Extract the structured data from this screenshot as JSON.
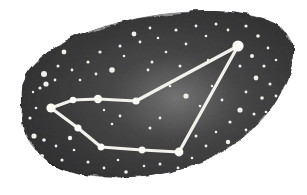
{
  "figure": {
    "kind": "constellation-star-chart-illustration",
    "width": 307,
    "height": 195,
    "background_color": "#ffffff"
  },
  "sky_patch": {
    "name": "dark-sky-blob",
    "description": "Irregular watercolor-washed dark grey patch of night sky with ragged edges",
    "fill_dark": "#2f2f30",
    "fill_mid": "#4a4a4c",
    "fill_light": "#8d8d8e",
    "edge_color": "#1b1b1c",
    "outline_path": "M 22 96 C 20 78, 34 60, 58 46 C 84 30, 120 20, 160 14 C 200 9, 238 10, 262 18 C 284 25, 295 38, 293 56 C 291 78, 280 100, 262 120 C 244 140, 220 156, 190 166 C 158 176, 122 180, 92 176 C 62 172, 40 160, 28 140 C 20 126, 22 110, 22 96 Z",
    "glow": {
      "name": "milky-way-glow",
      "center_x": 176,
      "center_y": 98,
      "radius_x": 62,
      "radius_y": 44,
      "color": "#b9b9b8"
    }
  },
  "constellation": {
    "name": "constellation-figure",
    "line_color": "#f2f1ec",
    "line_width": 3.2,
    "star_color": "#fbfaf5",
    "stars": [
      {
        "id": "apex",
        "label": "apex star",
        "x": 238,
        "y": 46,
        "r": 5.6
      },
      {
        "id": "junction",
        "label": "upper chain junction",
        "x": 136,
        "y": 101,
        "r": 3.6
      },
      {
        "id": "mid-upper",
        "label": "upper chain middle",
        "x": 98,
        "y": 99,
        "r": 4.2
      },
      {
        "id": "inner-upper",
        "label": "upper chain inner",
        "x": 73,
        "y": 100,
        "r": 3.2
      },
      {
        "id": "west-vertex",
        "label": "western vertex star",
        "x": 51,
        "y": 108,
        "r": 4.6
      },
      {
        "id": "lower-inner",
        "label": "lower chain inner",
        "x": 78,
        "y": 128,
        "r": 3.6
      },
      {
        "id": "lower-left",
        "label": "lower chain left",
        "x": 101,
        "y": 147,
        "r": 3.4
      },
      {
        "id": "lower-mid",
        "label": "lower chain middle",
        "x": 142,
        "y": 150,
        "r": 3.4
      },
      {
        "id": "south-vertex",
        "label": "southern vertex star",
        "x": 179,
        "y": 152,
        "r": 4.4
      }
    ],
    "segments": [
      {
        "from": "west-vertex",
        "to": "inner-upper"
      },
      {
        "from": "inner-upper",
        "to": "mid-upper"
      },
      {
        "from": "mid-upper",
        "to": "junction"
      },
      {
        "from": "junction",
        "to": "apex"
      },
      {
        "from": "apex",
        "to": "south-vertex"
      },
      {
        "from": "west-vertex",
        "to": "lower-inner"
      },
      {
        "from": "lower-inner",
        "to": "lower-left"
      },
      {
        "from": "lower-left",
        "to": "lower-mid"
      },
      {
        "from": "lower-mid",
        "to": "south-vertex"
      }
    ]
  },
  "background_stars": {
    "name": "background-star-field",
    "color": "#f0efe9",
    "points": [
      {
        "x": 40,
        "y": 88,
        "r": 1.6
      },
      {
        "x": 33,
        "y": 92,
        "r": 1.2
      },
      {
        "x": 46,
        "y": 84,
        "r": 2.6
      },
      {
        "x": 55,
        "y": 80,
        "r": 1.4
      },
      {
        "x": 44,
        "y": 74,
        "r": 3.0
      },
      {
        "x": 58,
        "y": 66,
        "r": 1.5
      },
      {
        "x": 64,
        "y": 52,
        "r": 2.4
      },
      {
        "x": 72,
        "y": 70,
        "r": 1.4
      },
      {
        "x": 36,
        "y": 108,
        "r": 1.3
      },
      {
        "x": 30,
        "y": 118,
        "r": 1.6
      },
      {
        "x": 34,
        "y": 136,
        "r": 2.6
      },
      {
        "x": 44,
        "y": 140,
        "r": 1.8
      },
      {
        "x": 30,
        "y": 148,
        "r": 1.4
      },
      {
        "x": 42,
        "y": 156,
        "r": 2.0
      },
      {
        "x": 56,
        "y": 146,
        "r": 1.4
      },
      {
        "x": 62,
        "y": 160,
        "r": 1.6
      },
      {
        "x": 74,
        "y": 150,
        "r": 1.3
      },
      {
        "x": 70,
        "y": 138,
        "r": 2.2
      },
      {
        "x": 88,
        "y": 162,
        "r": 1.5
      },
      {
        "x": 104,
        "y": 168,
        "r": 1.4
      },
      {
        "x": 118,
        "y": 160,
        "r": 1.3
      },
      {
        "x": 126,
        "y": 172,
        "r": 1.8
      },
      {
        "x": 80,
        "y": 80,
        "r": 1.3
      },
      {
        "x": 88,
        "y": 62,
        "r": 1.6
      },
      {
        "x": 96,
        "y": 74,
        "r": 1.4
      },
      {
        "x": 100,
        "y": 52,
        "r": 1.6
      },
      {
        "x": 112,
        "y": 70,
        "r": 2.8
      },
      {
        "x": 120,
        "y": 46,
        "r": 1.5
      },
      {
        "x": 124,
        "y": 56,
        "r": 1.3
      },
      {
        "x": 134,
        "y": 34,
        "r": 2.4
      },
      {
        "x": 140,
        "y": 42,
        "r": 1.4
      },
      {
        "x": 150,
        "y": 28,
        "r": 1.4
      },
      {
        "x": 158,
        "y": 38,
        "r": 1.3
      },
      {
        "x": 152,
        "y": 62,
        "r": 1.5
      },
      {
        "x": 148,
        "y": 70,
        "r": 1.4
      },
      {
        "x": 166,
        "y": 52,
        "r": 1.3
      },
      {
        "x": 176,
        "y": 30,
        "r": 1.6
      },
      {
        "x": 186,
        "y": 44,
        "r": 1.4
      },
      {
        "x": 180,
        "y": 66,
        "r": 1.5
      },
      {
        "x": 170,
        "y": 86,
        "r": 1.3
      },
      {
        "x": 186,
        "y": 96,
        "r": 2.6
      },
      {
        "x": 160,
        "y": 118,
        "r": 1.4
      },
      {
        "x": 150,
        "y": 128,
        "r": 1.5
      },
      {
        "x": 112,
        "y": 124,
        "r": 1.3
      },
      {
        "x": 120,
        "y": 116,
        "r": 1.4
      },
      {
        "x": 104,
        "y": 110,
        "r": 1.2
      },
      {
        "x": 196,
        "y": 26,
        "r": 1.4
      },
      {
        "x": 206,
        "y": 36,
        "r": 1.3
      },
      {
        "x": 216,
        "y": 24,
        "r": 1.5
      },
      {
        "x": 228,
        "y": 30,
        "r": 1.4
      },
      {
        "x": 246,
        "y": 26,
        "r": 1.6
      },
      {
        "x": 258,
        "y": 36,
        "r": 1.8
      },
      {
        "x": 268,
        "y": 48,
        "r": 1.4
      },
      {
        "x": 252,
        "y": 56,
        "r": 2.0
      },
      {
        "x": 240,
        "y": 66,
        "r": 1.5
      },
      {
        "x": 264,
        "y": 66,
        "r": 1.6
      },
      {
        "x": 276,
        "y": 60,
        "r": 1.3
      },
      {
        "x": 256,
        "y": 78,
        "r": 2.4
      },
      {
        "x": 270,
        "y": 84,
        "r": 1.5
      },
      {
        "x": 246,
        "y": 92,
        "r": 1.4
      },
      {
        "x": 262,
        "y": 98,
        "r": 1.8
      },
      {
        "x": 276,
        "y": 96,
        "r": 1.4
      },
      {
        "x": 240,
        "y": 110,
        "r": 2.6
      },
      {
        "x": 254,
        "y": 114,
        "r": 1.5
      },
      {
        "x": 266,
        "y": 112,
        "r": 1.3
      },
      {
        "x": 230,
        "y": 122,
        "r": 1.6
      },
      {
        "x": 246,
        "y": 130,
        "r": 1.4
      },
      {
        "x": 216,
        "y": 132,
        "r": 1.3
      },
      {
        "x": 228,
        "y": 142,
        "r": 2.2
      },
      {
        "x": 206,
        "y": 146,
        "r": 1.4
      },
      {
        "x": 196,
        "y": 136,
        "r": 1.5
      },
      {
        "x": 192,
        "y": 158,
        "r": 1.3
      },
      {
        "x": 178,
        "y": 168,
        "r": 1.4
      },
      {
        "x": 160,
        "y": 164,
        "r": 1.5
      },
      {
        "x": 144,
        "y": 166,
        "r": 1.3
      },
      {
        "x": 212,
        "y": 86,
        "r": 1.2
      },
      {
        "x": 200,
        "y": 106,
        "r": 1.3
      },
      {
        "x": 222,
        "y": 100,
        "r": 1.4
      },
      {
        "x": 208,
        "y": 60,
        "r": 1.2
      }
    ]
  }
}
